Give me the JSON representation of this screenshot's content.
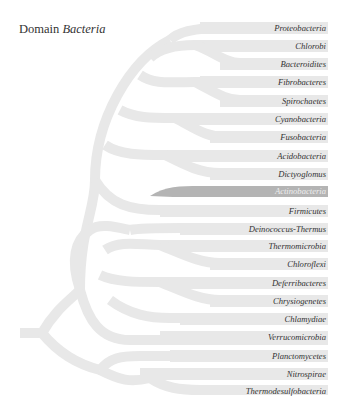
{
  "title": {
    "prefix": "Domain",
    "name": "Bacteria"
  },
  "colors": {
    "branch": "#e8e8e8",
    "highlight": "#b4b4b4",
    "text": "#333333",
    "highlight_text": "#eeeeee"
  },
  "highlighted": "Actinobacteria",
  "taxa": [
    {
      "label": "Proteobacteria"
    },
    {
      "label": "Chlorobi"
    },
    {
      "label": "Bacteroidites"
    },
    {
      "label": "Fibrobacteres"
    },
    {
      "label": "Spirochaetes"
    },
    {
      "label": "Cyanobacteria"
    },
    {
      "label": "Fusobacteria"
    },
    {
      "label": "Acidobacteria"
    },
    {
      "label": "Dictyoglomus"
    },
    {
      "label": "Actinobacteria"
    },
    {
      "label": "Firmicutes"
    },
    {
      "label": "Deinococcus-Thermus"
    },
    {
      "label": "Thermomicrobia"
    },
    {
      "label": "Chloroflexi"
    },
    {
      "label": "Deferribacteres"
    },
    {
      "label": "Chrysiogenetes"
    },
    {
      "label": "Chlamydiae"
    },
    {
      "label": "Verrucomicrobia"
    },
    {
      "label": "Planctomycetes"
    },
    {
      "label": "Nitrospirae"
    },
    {
      "label": "Thermodesulfobacteria"
    },
    {
      "label": "Thermotogae"
    },
    {
      "label": "Aquificae"
    }
  ]
}
